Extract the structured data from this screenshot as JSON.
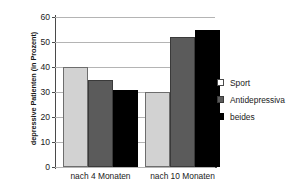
{
  "chart_data": {
    "type": "bar",
    "title": "",
    "subtitle": "",
    "xlabel": "",
    "ylabel": "depressive Patienten (in Prozent)",
    "categories": [
      "nach 4 Monaten",
      "nach 10 Monaten"
    ],
    "series": [
      {
        "name": "Sport",
        "values": [
          40,
          30
        ],
        "color": "#d2d2d2"
      },
      {
        "name": "Antidepressiva",
        "values": [
          35,
          52
        ],
        "color": "#5b5b5b"
      },
      {
        "name": "beides",
        "values": [
          31,
          55
        ],
        "color": "#000000"
      }
    ],
    "ylim": [
      0,
      60
    ],
    "yticks": [
      0,
      10,
      20,
      30,
      40,
      50,
      60
    ],
    "ytick_labels": [
      "0",
      "10",
      "20",
      "30",
      "40",
      "50",
      "60"
    ],
    "grid": true,
    "grid_axis": "y",
    "legend_position": "right",
    "annotations": []
  },
  "legend": {
    "entries": [
      {
        "label": "Sport",
        "swatch": "light"
      },
      {
        "label": "Antidepressiva",
        "swatch": "mid"
      },
      {
        "label": "beides",
        "swatch": "dark"
      }
    ]
  }
}
